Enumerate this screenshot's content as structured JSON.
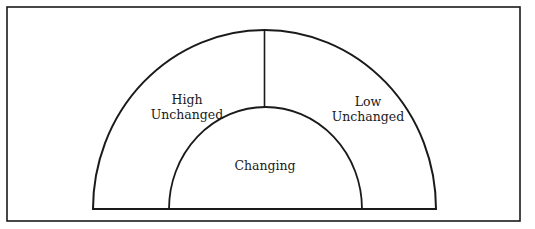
{
  "diagram": {
    "type": "nested-semicircle",
    "stroke_color": "#1a1a1a",
    "background": "#ffffff",
    "regions": {
      "high_unchanged": {
        "line1": "High",
        "line2": "Unchanged"
      },
      "low_unchanged": {
        "line1": "Low",
        "line2": "Unchanged"
      },
      "changing": {
        "label": "Changing"
      }
    }
  }
}
